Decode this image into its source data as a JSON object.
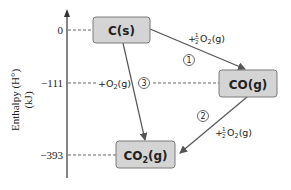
{
  "axis": {
    "label_line1": "Enthalpy (H°)",
    "label_line2": "(kJ)",
    "levels": [
      {
        "value": "0",
        "species": "C(s)"
      },
      {
        "value": "−111",
        "species": "CO(g)"
      },
      {
        "value": "−393",
        "species": "CO₂(g)"
      }
    ]
  },
  "boxes": {
    "c": "C(s)",
    "co_main": "CO(g)",
    "co2_main": "CO",
    "co2_sub": "2",
    "co2_tail": "(g)"
  },
  "steps": [
    {
      "number": "1",
      "reagent_prefix": "+",
      "frac_num": "1",
      "frac_den": "2",
      "reagent": "O",
      "reagent_sub": "2",
      "reagent_tail": "(g)"
    },
    {
      "number": "2",
      "reagent_prefix": "+",
      "frac_num": "1",
      "frac_den": "2",
      "reagent": "O",
      "reagent_sub": "2",
      "reagent_tail": "(g)"
    },
    {
      "number": "3",
      "reagent_prefix": "+",
      "reagent": "O",
      "reagent_sub": "2",
      "reagent_tail": "(g)"
    }
  ],
  "colors": {
    "box_fill": "#d4d4d4",
    "box_stroke": "#7a7a7a",
    "line": "#555555",
    "text": "#222222"
  }
}
